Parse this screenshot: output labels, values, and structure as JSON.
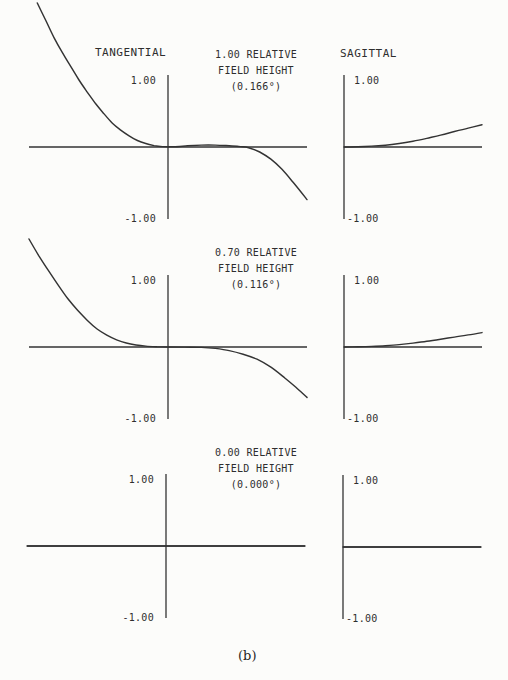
{
  "figure": {
    "caption": "(b)",
    "paper_color": "#fcfcfa",
    "ink_color": "#2e2e2e",
    "line_color": "#333333"
  },
  "columns": {
    "tangential": "TANGENTIAL",
    "sagittal": "SAGITTAL"
  },
  "y_axis": {
    "top_label": "1.00",
    "bottom_label": "-1.00"
  },
  "field_blocks": [
    {
      "line1": "1.00 RELATIVE",
      "line2": "FIELD HEIGHT",
      "angle": "(0.166°)"
    },
    {
      "line1": "0.70 RELATIVE",
      "line2": "FIELD HEIGHT",
      "angle": "(0.116°)"
    },
    {
      "line1": "0.00 RELATIVE",
      "line2": "FIELD HEIGHT",
      "angle": "(0.000°)"
    }
  ],
  "chart_data": {
    "type": "line",
    "xlabel": "normalized pupil coordinate",
    "ylabel": "transverse ray aberration",
    "ylim": [
      -1,
      1
    ],
    "grid": false,
    "legend_position": "none",
    "subplots": [
      {
        "name": "tangential-field-1p00",
        "column": "TANGENTIAL",
        "relative_field_height": 1.0,
        "field_angle_deg": 0.166,
        "origin_px": [
          168,
          147
        ],
        "x_scale_px": 139,
        "y_scale_px": 72,
        "h_axis_px": [
          29,
          307
        ],
        "v_axis_px": [
          75,
          219
        ],
        "tick_label_side": "left",
        "x_range": [
          -1,
          1
        ],
        "curve": [
          [
            -0.94,
            2.0
          ],
          [
            -0.88,
            1.76
          ],
          [
            -0.82,
            1.52
          ],
          [
            -0.76,
            1.31
          ],
          [
            -0.7,
            1.12
          ],
          [
            -0.64,
            0.93
          ],
          [
            -0.58,
            0.76
          ],
          [
            -0.52,
            0.6
          ],
          [
            -0.46,
            0.46
          ],
          [
            -0.4,
            0.33
          ],
          [
            -0.34,
            0.235
          ],
          [
            -0.28,
            0.155
          ],
          [
            -0.22,
            0.09
          ],
          [
            -0.16,
            0.048
          ],
          [
            -0.1,
            0.02
          ],
          [
            -0.04,
            0.005
          ],
          [
            0.04,
            0.004
          ],
          [
            0.14,
            0.016
          ],
          [
            0.24,
            0.026
          ],
          [
            0.34,
            0.027
          ],
          [
            0.44,
            0.018
          ],
          [
            0.52,
            0.006
          ],
          [
            0.58,
            -0.01
          ],
          [
            0.66,
            -0.07
          ],
          [
            0.74,
            -0.17
          ],
          [
            0.82,
            -0.31
          ],
          [
            0.9,
            -0.49
          ],
          [
            1.0,
            -0.73
          ]
        ]
      },
      {
        "name": "sagittal-field-1p00",
        "column": "SAGITTAL",
        "relative_field_height": 1.0,
        "field_angle_deg": 0.166,
        "origin_px": [
          344,
          147
        ],
        "x_scale_px": 138,
        "y_scale_px": 72,
        "h_axis_px": [
          344,
          482
        ],
        "v_axis_px": [
          75,
          219
        ],
        "tick_label_side": "right",
        "x_range": [
          0,
          1
        ],
        "curve": [
          [
            0,
            0
          ],
          [
            0.1,
            0.004
          ],
          [
            0.2,
            0.012
          ],
          [
            0.3,
            0.025
          ],
          [
            0.4,
            0.048
          ],
          [
            0.5,
            0.08
          ],
          [
            0.6,
            0.12
          ],
          [
            0.7,
            0.165
          ],
          [
            0.8,
            0.215
          ],
          [
            0.9,
            0.262
          ],
          [
            1.0,
            0.31
          ]
        ]
      },
      {
        "name": "tangential-field-0p70",
        "column": "TANGENTIAL",
        "relative_field_height": 0.7,
        "field_angle_deg": 0.116,
        "origin_px": [
          168,
          347
        ],
        "x_scale_px": 139,
        "y_scale_px": 72,
        "h_axis_px": [
          29,
          307
        ],
        "v_axis_px": [
          275,
          419
        ],
        "tick_label_side": "left",
        "x_range": [
          -1,
          1
        ],
        "curve": [
          [
            -1.0,
            1.5
          ],
          [
            -0.93,
            1.27
          ],
          [
            -0.86,
            1.06
          ],
          [
            -0.79,
            0.86
          ],
          [
            -0.72,
            0.67
          ],
          [
            -0.65,
            0.51
          ],
          [
            -0.58,
            0.37
          ],
          [
            -0.51,
            0.25
          ],
          [
            -0.44,
            0.165
          ],
          [
            -0.37,
            0.1
          ],
          [
            -0.3,
            0.055
          ],
          [
            -0.23,
            0.028
          ],
          [
            -0.16,
            0.012
          ],
          [
            -0.08,
            0.003
          ],
          [
            0.0,
            0.0
          ],
          [
            0.12,
            -0.002
          ],
          [
            0.24,
            -0.006
          ],
          [
            0.34,
            -0.02
          ],
          [
            0.44,
            -0.05
          ],
          [
            0.54,
            -0.1
          ],
          [
            0.64,
            -0.17
          ],
          [
            0.74,
            -0.28
          ],
          [
            0.84,
            -0.43
          ],
          [
            0.92,
            -0.56
          ],
          [
            1.0,
            -0.7
          ]
        ]
      },
      {
        "name": "sagittal-field-0p70",
        "column": "SAGITTAL",
        "relative_field_height": 0.7,
        "field_angle_deg": 0.116,
        "origin_px": [
          344,
          347
        ],
        "x_scale_px": 138,
        "y_scale_px": 72,
        "h_axis_px": [
          344,
          482
        ],
        "v_axis_px": [
          275,
          419
        ],
        "tick_label_side": "right",
        "x_range": [
          0,
          1
        ],
        "curve": [
          [
            0,
            0
          ],
          [
            0.1,
            0.003
          ],
          [
            0.2,
            0.008
          ],
          [
            0.3,
            0.018
          ],
          [
            0.4,
            0.033
          ],
          [
            0.5,
            0.054
          ],
          [
            0.6,
            0.08
          ],
          [
            0.7,
            0.108
          ],
          [
            0.8,
            0.138
          ],
          [
            0.9,
            0.168
          ],
          [
            1.0,
            0.2
          ]
        ]
      },
      {
        "name": "tangential-field-0p00",
        "column": "TANGENTIAL",
        "relative_field_height": 0.0,
        "field_angle_deg": 0.0,
        "origin_px": [
          166,
          546
        ],
        "x_scale_px": 139,
        "y_scale_px": 72,
        "h_axis_px": [
          27,
          305
        ],
        "v_axis_px": [
          474,
          618
        ],
        "tick_label_side": "left",
        "x_range": [
          -1,
          1
        ],
        "curve": [
          [
            -1.0,
            0.0
          ],
          [
            0.0,
            0.0
          ],
          [
            1.0,
            0.0
          ]
        ]
      },
      {
        "name": "sagittal-field-0p00",
        "column": "SAGITTAL",
        "relative_field_height": 0.0,
        "field_angle_deg": 0.0,
        "origin_px": [
          343,
          547
        ],
        "x_scale_px": 138,
        "y_scale_px": 72,
        "h_axis_px": [
          343,
          481
        ],
        "v_axis_px": [
          475,
          619
        ],
        "tick_label_side": "right",
        "x_range": [
          0,
          1
        ],
        "curve": [
          [
            0.0,
            0.0
          ],
          [
            0.5,
            0.0
          ],
          [
            1.0,
            0.0
          ]
        ]
      }
    ]
  }
}
